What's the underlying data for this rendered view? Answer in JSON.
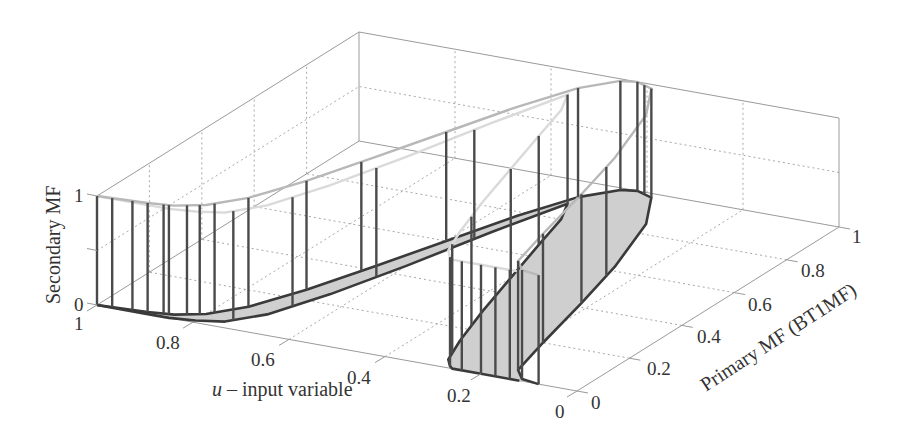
{
  "chart_data": {
    "type": "surface3d",
    "title": "",
    "xlabel": "u – input variable",
    "xlabel_italic_prefix": "u",
    "xlabel_rest": " – input variable",
    "ylabel": "Primary MF (BT1MF)",
    "zlabel": "Secondary MF",
    "x_ticks": [
      "0",
      "0.2",
      "0.4",
      "0.6",
      "0.8",
      "1"
    ],
    "x_tick_values": [
      0,
      0.2,
      0.4,
      0.6,
      0.8,
      1
    ],
    "y_ticks": [
      "0",
      "0.2",
      "0.4",
      "0.6",
      "0.8",
      "1"
    ],
    "y_tick_values": [
      0,
      0.2,
      0.4,
      0.6,
      0.8,
      1
    ],
    "z_ticks": [
      "0",
      "1"
    ],
    "z_tick_values": [
      0,
      1
    ],
    "xlim": [
      0,
      1
    ],
    "ylim": [
      0,
      1
    ],
    "zlim": [
      0,
      1
    ],
    "grid": true,
    "projection": {
      "origin_px": [
        577,
        391
      ],
      "u_unit_px": [
        -480,
        -86
      ],
      "p_unit_px": [
        262,
        -164
      ],
      "z_unit_px": [
        0,
        -109
      ]
    },
    "footprint": {
      "description": "Footprint of uncertainty (shaded band) bounded by upper and lower primary MFs",
      "upper_mf": {
        "u": [
          1.0,
          0.9,
          0.85,
          0.8,
          0.75,
          0.7,
          0.65,
          0.6,
          0.55,
          0.5,
          0.45,
          0.42,
          0.38,
          0.32,
          0.26,
          0.22,
          0.18,
          0.15,
          0.12,
          0.08
        ],
        "p": [
          0.0,
          0.01,
          0.02,
          0.05,
          0.12,
          0.25,
          0.42,
          0.6,
          0.78,
          0.92,
          0.99,
          1.0,
          0.98,
          0.85,
          0.62,
          0.42,
          0.2,
          0.05,
          0.01,
          0.0
        ]
      },
      "lower_mf": {
        "u": [
          1.0,
          0.9,
          0.85,
          0.8,
          0.75,
          0.7,
          0.65,
          0.6,
          0.55,
          0.5,
          0.47,
          0.44,
          0.4,
          0.36,
          0.32,
          0.29,
          0.27,
          0.26,
          0.2,
          0.12
        ],
        "p": [
          0.0,
          0.0,
          0.0,
          0.01,
          0.03,
          0.1,
          0.25,
          0.45,
          0.68,
          0.88,
          0.8,
          0.66,
          0.48,
          0.3,
          0.14,
          0.04,
          0.01,
          0.0,
          0.0,
          0.0
        ]
      },
      "fill_color": "#cfcfcf",
      "edge_color": "#3a3a3a"
    },
    "secondary_mf": {
      "description": "Vertical stems of secondary membership height 1 over the footprint",
      "stem_height": 1,
      "stems_on_upper": [
        1.0,
        0.97,
        0.93,
        0.9,
        0.87,
        0.86,
        0.83,
        0.81,
        0.79,
        0.75,
        0.7,
        0.66,
        0.6,
        0.5,
        0.45,
        0.42,
        0.4,
        0.38,
        0.25,
        0.22,
        0.18,
        0.15,
        0.12
      ],
      "stems_on_lower": [
        0.74,
        0.68,
        0.62,
        0.56,
        0.5,
        0.44,
        0.4,
        0.34,
        0.3,
        0.27,
        0.24,
        0.2,
        0.17,
        0.14
      ],
      "stem_color": "#4a4a4a",
      "top_upper_color": "#b8b8b8",
      "top_lower_color": "#dadada"
    },
    "colors": {
      "box": "#9a9a9a",
      "grid": "#a8a8a8",
      "text": "#333333"
    }
  }
}
